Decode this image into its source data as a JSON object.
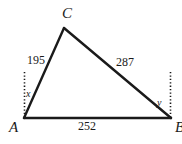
{
  "figure": {
    "type": "triangle-diagram",
    "background_color": "#ffffff",
    "stroke_color": "#1a1a1a"
  },
  "vertices": {
    "c": {
      "label": "C",
      "x": 64,
      "y": 28
    },
    "a": {
      "label": "A",
      "x": 24,
      "y": 118
    },
    "b": {
      "label": "B",
      "x": 171,
      "y": 118
    }
  },
  "sides": {
    "ac": {
      "label": "195",
      "value": 195
    },
    "cb": {
      "label": "287",
      "value": 287
    },
    "ab": {
      "label": "252",
      "value": 252
    }
  },
  "angles": {
    "at_a": {
      "label": "x"
    },
    "at_b": {
      "label": "y"
    }
  },
  "reference_lines": {
    "left": {
      "name": "vertical-dotted-line-at-a",
      "x": 24,
      "y_top": 72,
      "y_bottom": 118
    },
    "right": {
      "name": "vertical-dotted-line-at-b",
      "x": 170,
      "y_top": 72,
      "y_bottom": 118
    }
  }
}
